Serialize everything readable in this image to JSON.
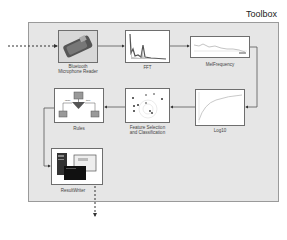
{
  "toolbox": {
    "title": "Toolbox"
  },
  "blocks": [
    {
      "id": "bluetooth",
      "label_line1": "Bluetooth",
      "label_line2": "Microphone Reader"
    },
    {
      "id": "fft",
      "label": "FFT"
    },
    {
      "id": "melfrequency",
      "label": "MelFrequency"
    },
    {
      "id": "log10",
      "label": "Log10"
    },
    {
      "id": "feature",
      "label_line1": "Feature Selection",
      "label_line2": "and Classification"
    },
    {
      "id": "rules",
      "label": "Rules",
      "branch_left": "false",
      "branch_right": "true"
    },
    {
      "id": "resultwriter",
      "label": "ResultWriter"
    }
  ],
  "colors": {
    "panel_bg": "#e6e6e6",
    "panel_border": "#9a9a9a",
    "block_border": "#6e6e6e",
    "wire": "#555555"
  }
}
